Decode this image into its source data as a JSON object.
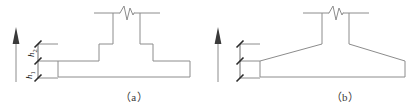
{
  "figure": {
    "line_color": "#8c8c8c",
    "ink_color": "#2b2b2b",
    "width": 418,
    "height": 110
  },
  "panels": [
    {
      "id": "a",
      "caption": "（a）",
      "type": "stepped-footing",
      "description": "Reinforced concrete column on a two-step stepped spread footing",
      "elements": {
        "column": "column-with-break-symbol",
        "break_symbol": "zigzag-break-line",
        "footing": "two-tier-stepped-base"
      },
      "dimensions": {
        "upper": {
          "label": "h",
          "subscript": "2"
        },
        "lower": {
          "label": "h",
          "subscript": "1"
        },
        "arrow": "up-arrow-elevation-marker",
        "tick_style": "slash-tick"
      }
    },
    {
      "id": "b",
      "caption": "（b）",
      "type": "sloped-footing",
      "description": "Reinforced concrete column on a sloped (tapered) spread footing",
      "elements": {
        "column": "column-with-break-symbol",
        "break_symbol": "zigzag-break-line",
        "footing": "tapered-base"
      },
      "dimensions": {
        "upper": {
          "label": "h",
          "subscript": "2"
        },
        "lower": {
          "label": "h",
          "subscript": "1"
        },
        "arrow": "up-arrow-elevation-marker",
        "tick_style": "slash-tick"
      }
    }
  ]
}
